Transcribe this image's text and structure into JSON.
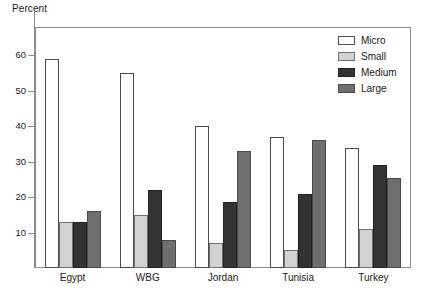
{
  "chart_data": {
    "type": "bar",
    "title": "",
    "ylabel": "Percent",
    "xlabel": "",
    "ylim": [
      0,
      68
    ],
    "yticks": [
      10,
      20,
      30,
      40,
      50,
      60
    ],
    "grid": false,
    "legend_position": "top-right",
    "categories": [
      "Egypt",
      "WBG",
      "Jordan",
      "Tunisia",
      "Turkey"
    ],
    "series": [
      {
        "name": "Micro",
        "color": "#ffffff",
        "values": [
          59,
          55,
          40,
          37,
          34
        ]
      },
      {
        "name": "Small",
        "color": "#d2d2d2",
        "values": [
          13,
          15,
          7,
          5,
          11
        ]
      },
      {
        "name": "Medium",
        "color": "#333333",
        "values": [
          13,
          22,
          18.5,
          21,
          29
        ]
      },
      {
        "name": "Large",
        "color": "#6f6f6f",
        "values": [
          16,
          8,
          33,
          36,
          25.5
        ]
      }
    ]
  },
  "legend": {
    "items": [
      {
        "label": "Micro"
      },
      {
        "label": "Small"
      },
      {
        "label": "Medium"
      },
      {
        "label": "Large"
      }
    ]
  },
  "axes": {
    "y_title": "Percent",
    "y_tick_labels": [
      "60",
      "50",
      "40",
      "30",
      "20",
      "10"
    ],
    "x_tick_labels": [
      "Egypt",
      "WBG",
      "Jordan",
      "Tunisia",
      "Turkey"
    ]
  }
}
